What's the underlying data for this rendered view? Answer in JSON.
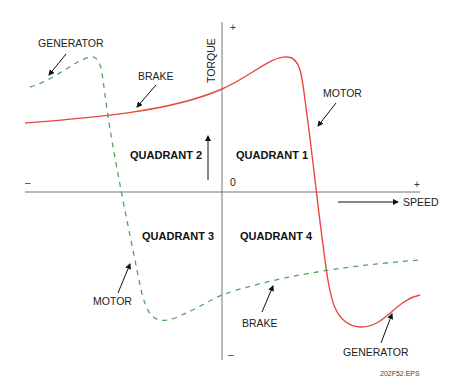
{
  "diagram": {
    "axes": {
      "vertical_label": "TORQUE",
      "horizontal_label": "SPEED",
      "origin_label": "0",
      "top_sign": "+",
      "bottom_sign": "–",
      "left_sign": "–",
      "right_sign": "+"
    },
    "quadrants": {
      "q1": "QUADRANT 1",
      "q2": "QUADRANT 2",
      "q3": "QUADRANT 3",
      "q4": "QUADRANT 4"
    },
    "curves": {
      "solid": {
        "color": "#e8473c",
        "style": "solid"
      },
      "dashed": {
        "color": "#4fa65a",
        "style": "dashed"
      }
    },
    "annotations": {
      "generator_top_left": "GENERATOR",
      "brake_top": "BRAKE",
      "motor_top_right": "MOTOR",
      "motor_bottom_left": "MOTOR",
      "brake_bottom": "BRAKE",
      "generator_bottom_right": "GENERATOR"
    },
    "file_label": "202F52.EPS"
  }
}
